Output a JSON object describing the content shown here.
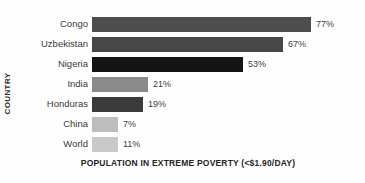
{
  "chart_data": {
    "type": "bar",
    "orientation": "horizontal",
    "title": "",
    "xlabel": "POPULATION IN EXTREME POVERTY (<$1.90/DAY)",
    "ylabel": "COUNTRY",
    "categories": [
      "Congo",
      "Uzbekistan",
      "Nigeria",
      "India",
      "Honduras",
      "China",
      "World"
    ],
    "values": [
      77,
      67,
      53,
      21,
      19,
      7,
      11
    ],
    "value_labels": [
      "77%",
      "67%",
      "53%",
      "21%",
      "19%",
      "7%",
      "11%"
    ],
    "bar_colors": [
      "#4d4d4d",
      "#474749",
      "#141416",
      "#8b8b8d",
      "#3b3b3d",
      "#bdbdbf",
      "#c9c9cb"
    ],
    "bar_pixel_widths": [
      219,
      191,
      151,
      56,
      51,
      26,
      26
    ],
    "xlim": [
      0,
      100
    ],
    "grid": false,
    "legend": null,
    "background": "#fdfdfd"
  }
}
